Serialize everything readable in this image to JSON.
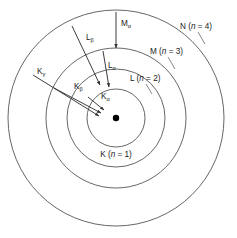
{
  "figure": {
    "type": "atomic-shell-xray-transition-diagram",
    "center": {
      "x": 116,
      "y": 118
    },
    "nucleus": {
      "name": "nucleus-dot",
      "radius": 3.2,
      "color": "#000000"
    }
  },
  "colors": {
    "stroke": "#555555",
    "arrow": "#333333",
    "text": "#1a1a1a",
    "background": "#ffffff",
    "leader": "#6a6a6a"
  },
  "shells": [
    {
      "key": "K",
      "letter": "K",
      "n_text": "(n = 1)",
      "n": 1,
      "radius": 29,
      "label_full": "K (n = 1)",
      "label_x": 116,
      "label_y": 157,
      "leader": null
    },
    {
      "key": "L",
      "letter": "L",
      "n_text": "(n = 2)",
      "n": 2,
      "radius": 49,
      "label_full": "L (n = 2)",
      "label_x": 130,
      "label_y": 81,
      "leader": {
        "x1": 146,
        "y1": 84,
        "x2": 152,
        "y2": 94
      }
    },
    {
      "key": "M",
      "letter": "M",
      "n_text": "(n = 3)",
      "n": 3,
      "radius": 70,
      "label_full": "M (n = 3)",
      "label_x": 150,
      "label_y": 54,
      "leader": {
        "x1": 168,
        "y1": 57,
        "x2": 175,
        "y2": 69
      }
    },
    {
      "key": "N",
      "letter": "N",
      "n_text": "(n = 4)",
      "n": 4,
      "radius": 108,
      "label_full": "N (n = 4)",
      "label_x": 180,
      "label_y": 29,
      "leader": {
        "x1": 198,
        "y1": 32,
        "x2": 205,
        "y2": 44
      }
    }
  ],
  "transitions": [
    {
      "key": "K-alpha",
      "series": "K",
      "greek": "α",
      "label": "K",
      "from_shell": "L",
      "to_shell": "K",
      "x1": 88,
      "y1": 97,
      "x2": 104,
      "y2": 110,
      "label_x": 101,
      "label_y": 99
    },
    {
      "key": "K-beta",
      "series": "K",
      "greek": "β",
      "label": "K",
      "from_shell": "M",
      "to_shell": "K",
      "x1": 54,
      "y1": 88,
      "x2": 101,
      "y2": 113,
      "label_x": 74,
      "label_y": 89
    },
    {
      "key": "K-gamma",
      "series": "K",
      "greek": "γ",
      "label": "K",
      "from_shell": "N",
      "to_shell": "K",
      "x1": 33,
      "y1": 75,
      "x2": 99,
      "y2": 116,
      "label_x": 37,
      "label_y": 74
    },
    {
      "key": "L-alpha",
      "series": "L",
      "greek": "α",
      "label": "L",
      "from_shell": "M",
      "to_shell": "L",
      "x1": 103,
      "y1": 51,
      "x2": 109,
      "y2": 87,
      "label_x": 108,
      "label_y": 68
    },
    {
      "key": "L-beta",
      "series": "L",
      "greek": "β",
      "label": "L",
      "from_shell": "N",
      "to_shell": "L",
      "x1": 72,
      "y1": 26,
      "x2": 100,
      "y2": 85,
      "label_x": 86,
      "label_y": 40
    },
    {
      "key": "M-alpha",
      "series": "M",
      "greek": "α",
      "label": "M",
      "from_shell": "N",
      "to_shell": "M",
      "x1": 116,
      "y1": 12,
      "x2": 116,
      "y2": 48,
      "label_x": 121,
      "label_y": 26
    }
  ]
}
